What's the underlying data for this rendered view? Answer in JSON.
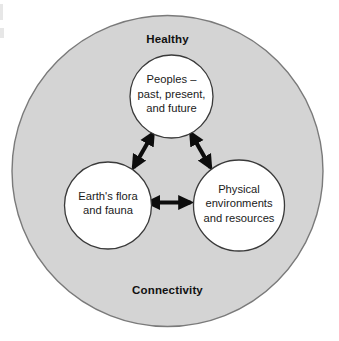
{
  "diagram": {
    "type": "venn-like-concentric",
    "title_top": "Healthy",
    "title_bottom": "Connectivity",
    "outer_circle": {
      "name": "healthy-connectivity-container",
      "fill_color": "#d4d4d4",
      "stroke_color": "#7a7a7a"
    },
    "nodes": [
      {
        "id": "peoples",
        "lines": [
          "Peoples –",
          "past, present,",
          "and future"
        ],
        "fill_color": "#ffffff",
        "stroke_color": "#3a3a3a"
      },
      {
        "id": "flora-fauna",
        "lines": [
          "Earth's flora",
          "and fauna"
        ],
        "fill_color": "#ffffff",
        "stroke_color": "#3a3a3a"
      },
      {
        "id": "physical-environments",
        "lines": [
          "Physical",
          "environments",
          "and resources"
        ],
        "fill_color": "#ffffff",
        "stroke_color": "#3a3a3a"
      }
    ],
    "connectors": [
      {
        "id": "peoples-to-flora",
        "style": "double-headed-arrow",
        "color": "#0d0d0d"
      },
      {
        "id": "peoples-to-physical",
        "style": "double-headed-arrow",
        "color": "#0d0d0d"
      },
      {
        "id": "flora-to-physical",
        "style": "double-headed-arrow",
        "color": "#0d0d0d"
      }
    ]
  }
}
